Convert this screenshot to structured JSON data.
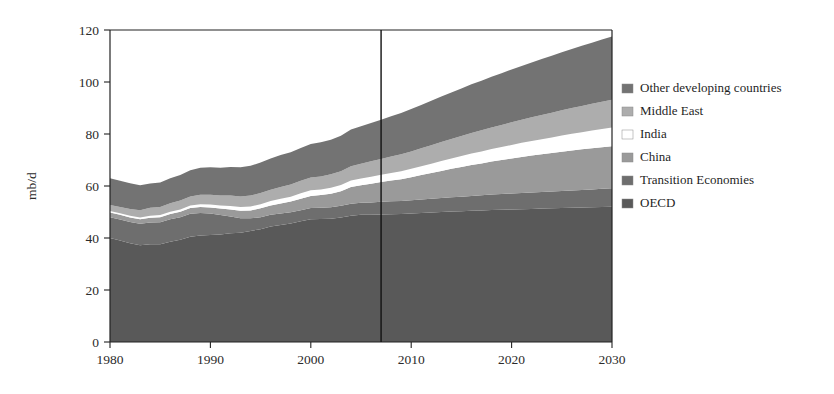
{
  "chart_data": {
    "type": "area",
    "stacked": true,
    "title": "",
    "xlabel": "",
    "ylabel": "mb/d",
    "xlim": [
      1980,
      2030
    ],
    "ylim": [
      0,
      120
    ],
    "ytick_labels": [
      "0",
      "20",
      "40",
      "60",
      "80",
      "100",
      "120"
    ],
    "yticks": [
      0,
      20,
      40,
      60,
      80,
      100,
      120
    ],
    "xtick_labels": [
      "1980",
      "1990",
      "2000",
      "2010",
      "2020",
      "2030"
    ],
    "xticks": [
      1980,
      1990,
      2000,
      2010,
      2020,
      2030
    ],
    "grid": false,
    "legend_position": "right",
    "annotations": [
      {
        "name": "projection-divider",
        "type": "vline",
        "x": 2007,
        "label": ""
      }
    ],
    "x": [
      1980,
      1981,
      1982,
      1983,
      1984,
      1985,
      1986,
      1987,
      1988,
      1989,
      1990,
      1991,
      1992,
      1993,
      1994,
      1995,
      1996,
      1997,
      1998,
      1999,
      2000,
      2001,
      2002,
      2003,
      2004,
      2005,
      2006,
      2007,
      2008,
      2009,
      2010,
      2011,
      2012,
      2013,
      2014,
      2015,
      2016,
      2017,
      2018,
      2019,
      2020,
      2021,
      2022,
      2023,
      2024,
      2025,
      2026,
      2027,
      2028,
      2029,
      2030
    ],
    "series": [
      {
        "name": "OECD",
        "color": "#595959",
        "values": [
          40.0,
          39.0,
          38.0,
          37.2,
          37.6,
          37.6,
          38.6,
          39.3,
          40.5,
          41.0,
          41.2,
          41.3,
          41.8,
          42.0,
          42.7,
          43.4,
          44.4,
          45.0,
          45.6,
          46.4,
          47.2,
          47.3,
          47.4,
          47.9,
          48.6,
          48.9,
          48.9,
          49.0,
          49.1,
          49.2,
          49.4,
          49.6,
          49.8,
          50.0,
          50.2,
          50.3,
          50.5,
          50.6,
          50.8,
          50.9,
          51.0,
          51.1,
          51.2,
          51.3,
          51.4,
          51.5,
          51.6,
          51.7,
          51.8,
          51.9,
          52.0
        ]
      },
      {
        "name": "Transition Economies",
        "color": "#6e6e6e",
        "values": [
          8.0,
          8.1,
          8.2,
          8.3,
          8.4,
          8.5,
          8.6,
          8.7,
          8.8,
          8.6,
          8.2,
          7.5,
          6.5,
          5.6,
          4.9,
          4.6,
          4.5,
          4.4,
          4.3,
          4.3,
          4.3,
          4.3,
          4.4,
          4.5,
          4.6,
          4.7,
          4.8,
          4.9,
          5.0,
          5.0,
          5.1,
          5.2,
          5.3,
          5.4,
          5.5,
          5.6,
          5.7,
          5.8,
          5.9,
          6.0,
          6.1,
          6.2,
          6.3,
          6.4,
          6.5,
          6.6,
          6.7,
          6.8,
          6.9,
          7.0,
          7.1
        ]
      },
      {
        "name": "China",
        "color": "#9a9a9a",
        "values": [
          1.8,
          1.8,
          1.7,
          1.7,
          1.8,
          1.9,
          2.0,
          2.1,
          2.2,
          2.3,
          2.3,
          2.5,
          2.7,
          2.9,
          3.0,
          3.4,
          3.6,
          3.9,
          4.1,
          4.4,
          4.7,
          4.9,
          5.2,
          5.6,
          6.4,
          6.7,
          7.2,
          7.6,
          8.0,
          8.4,
          8.9,
          9.4,
          9.9,
          10.4,
          10.9,
          11.4,
          11.9,
          12.3,
          12.7,
          13.1,
          13.5,
          13.9,
          14.2,
          14.5,
          14.8,
          15.1,
          15.4,
          15.6,
          15.8,
          16.0,
          16.2
        ]
      },
      {
        "name": "India",
        "color": "#ffffff",
        "values": [
          0.6,
          0.6,
          0.7,
          0.7,
          0.8,
          0.8,
          0.9,
          0.9,
          1.0,
          1.1,
          1.2,
          1.2,
          1.3,
          1.4,
          1.5,
          1.6,
          1.7,
          1.8,
          1.9,
          2.1,
          2.2,
          2.2,
          2.3,
          2.4,
          2.5,
          2.6,
          2.7,
          2.8,
          2.9,
          3.1,
          3.2,
          3.4,
          3.6,
          3.8,
          4.0,
          4.2,
          4.4,
          4.6,
          4.8,
          5.0,
          5.2,
          5.4,
          5.6,
          5.8,
          6.0,
          6.2,
          6.4,
          6.6,
          6.8,
          7.0,
          7.2
        ]
      },
      {
        "name": "Middle East",
        "color": "#adadad",
        "values": [
          2.3,
          2.4,
          2.6,
          2.8,
          3.0,
          3.1,
          3.3,
          3.4,
          3.5,
          3.6,
          3.7,
          3.8,
          4.0,
          4.1,
          4.2,
          4.3,
          4.4,
          4.5,
          4.7,
          4.8,
          4.9,
          5.0,
          5.2,
          5.3,
          5.5,
          5.7,
          5.9,
          6.1,
          6.3,
          6.5,
          6.7,
          6.9,
          7.1,
          7.3,
          7.5,
          7.7,
          7.9,
          8.1,
          8.3,
          8.5,
          8.7,
          8.9,
          9.1,
          9.3,
          9.5,
          9.7,
          9.9,
          10.1,
          10.3,
          10.5,
          10.7
        ]
      },
      {
        "name": "Other developing countries",
        "color": "#737373",
        "values": [
          10.3,
          10.1,
          9.9,
          9.6,
          9.4,
          9.4,
          9.6,
          9.8,
          10.1,
          10.4,
          10.6,
          10.7,
          11.0,
          11.2,
          11.5,
          11.7,
          12.0,
          12.3,
          12.4,
          12.6,
          12.9,
          13.1,
          13.3,
          13.6,
          14.1,
          14.4,
          14.7,
          15.1,
          15.5,
          15.9,
          16.3,
          16.7,
          17.1,
          17.5,
          17.9,
          18.3,
          18.7,
          19.1,
          19.5,
          19.9,
          20.3,
          20.7,
          21.1,
          21.5,
          21.9,
          22.3,
          22.7,
          23.1,
          23.5,
          23.9,
          24.3
        ]
      }
    ],
    "totals": [
      63.0,
      62.0,
      61.1,
      60.3,
      61.0,
      61.3,
      63.0,
      64.2,
      66.1,
      67.0,
      67.2,
      67.0,
      67.3,
      67.2,
      67.8,
      69.0,
      70.6,
      71.9,
      73.0,
      74.6,
      76.2,
      76.8,
      77.8,
      79.3,
      81.7,
      83.0,
      84.2,
      85.5,
      86.8,
      88.1,
      89.6,
      91.2,
      92.8,
      94.4,
      96.0,
      97.5,
      99.1,
      100.5,
      102.0,
      103.4,
      104.8,
      106.2,
      107.5,
      108.8,
      110.1,
      111.4,
      112.7,
      113.9,
      115.1,
      116.3,
      117.5
    ]
  },
  "legend": {
    "entries": [
      {
        "label": "Other developing countries",
        "color": "#737373"
      },
      {
        "label": "Middle East",
        "color": "#adadad"
      },
      {
        "label": "India",
        "color": "#ffffff"
      },
      {
        "label": "China",
        "color": "#9a9a9a"
      },
      {
        "label": "Transition Economies",
        "color": "#6e6e6e"
      },
      {
        "label": "OECD",
        "color": "#595959"
      }
    ]
  },
  "axis": {
    "y_title": "mb/d",
    "y_labels": [
      "120",
      "100",
      "80",
      "60",
      "40",
      "20",
      "0"
    ],
    "x_labels": [
      "1980",
      "1990",
      "2000",
      "2010",
      "2020",
      "2030"
    ]
  }
}
